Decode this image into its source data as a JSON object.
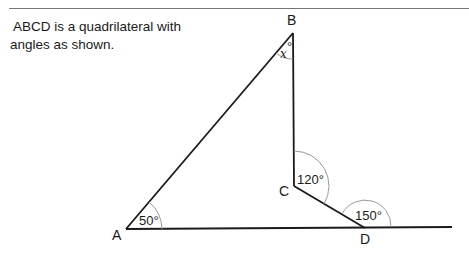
{
  "problem": {
    "line1": "ABCD is a quadrilateral with",
    "line2": "angles as shown."
  },
  "vertices": {
    "A": "A",
    "B": "B",
    "C": "C",
    "D": "D"
  },
  "angles": {
    "A": "50°",
    "B_var": "x",
    "B_deg": "°",
    "C": "120°",
    "D_exterior": "150°"
  },
  "colors": {
    "lines": "#1a1a1a",
    "arcs": "#999999",
    "rule": "#777777"
  }
}
